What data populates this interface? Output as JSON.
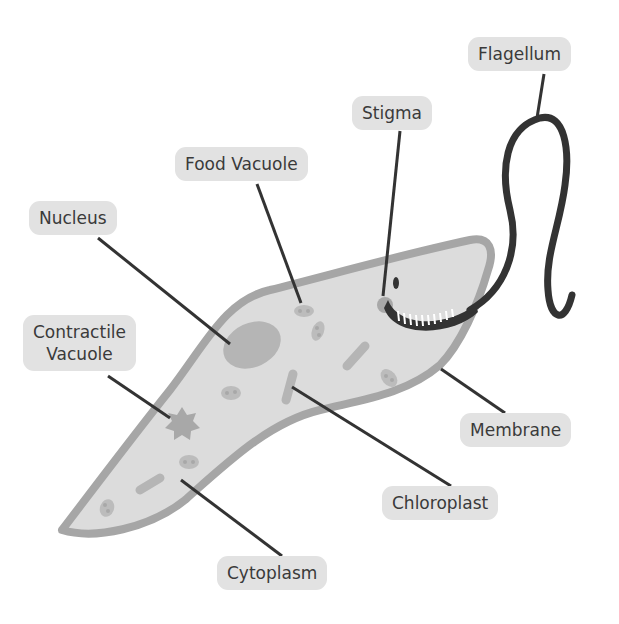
{
  "diagram": {
    "labels": {
      "flagellum": "Flagellum",
      "stigma": "Stigma",
      "food_vacuole": "Food Vacuole",
      "nucleus": "Nucleus",
      "contractile_vacuole_line1": "Contractile",
      "contractile_vacuole_line2": "Vacuole",
      "membrane": "Membrane",
      "chloroplast": "Chloroplast",
      "cytoplasm": "Cytoplasm"
    },
    "colors": {
      "background": "#ffffff",
      "label_fill": "#e2e2e2",
      "label_text": "#3a3a3a",
      "cell_fill": "#dcdcdc",
      "membrane": "#a6a6a6",
      "organelle": "#b8b8b8",
      "leader_line": "#333333",
      "flagellum": "#333333"
    }
  }
}
